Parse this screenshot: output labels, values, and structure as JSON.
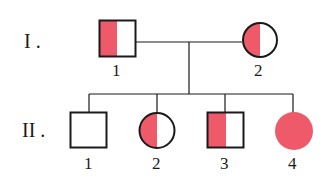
{
  "diagram": {
    "type": "pedigree",
    "colors": {
      "affected": "#ef5a6a",
      "line": "#1a1a1a",
      "background": "#ffffff"
    },
    "generations": [
      {
        "label": "I .",
        "members": [
          {
            "number": "1",
            "sex": "male",
            "fill": "half-left"
          },
          {
            "number": "2",
            "sex": "female",
            "fill": "half-left"
          }
        ]
      },
      {
        "label": "II .",
        "members": [
          {
            "number": "1",
            "sex": "male",
            "fill": "none"
          },
          {
            "number": "2",
            "sex": "female",
            "fill": "half-left"
          },
          {
            "number": "3",
            "sex": "male",
            "fill": "half-left"
          },
          {
            "number": "4",
            "sex": "female",
            "fill": "full"
          }
        ]
      }
    ]
  }
}
